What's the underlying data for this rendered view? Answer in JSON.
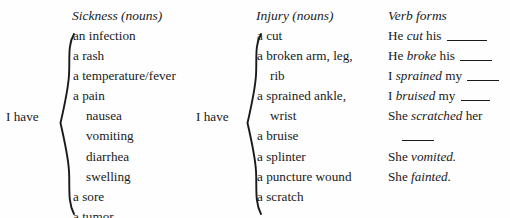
{
  "columns": [
    {
      "id": "sickness",
      "header": "Sickness (nouns)",
      "prefix_label": "I have",
      "items": [
        {
          "text": "an infection",
          "indent": false
        },
        {
          "text": "a rash",
          "indent": false
        },
        {
          "text": "a temperature/fever",
          "indent": false
        },
        {
          "text": "a pain",
          "indent": false
        },
        {
          "text": "nausea",
          "indent": true
        },
        {
          "text": "vomiting",
          "indent": true
        },
        {
          "text": "diarrhea",
          "indent": true
        },
        {
          "text": "swelling",
          "indent": true
        },
        {
          "text": "a sore",
          "indent": false
        },
        {
          "text": "a tumor",
          "indent": false
        }
      ]
    },
    {
      "id": "injury",
      "header": "Injury (nouns)",
      "prefix_label": "I have",
      "items": [
        {
          "text": "a cut",
          "indent": false
        },
        {
          "text": "a broken arm, leg,",
          "indent": false
        },
        {
          "text": "rib",
          "indent": true
        },
        {
          "text": "a sprained ankle,",
          "indent": false
        },
        {
          "text": "wrist",
          "indent": true
        },
        {
          "text": "a bruise",
          "indent": false
        },
        {
          "text": "a splinter",
          "indent": false
        },
        {
          "text": "a puncture wound",
          "indent": false
        },
        {
          "text": "a scratch",
          "indent": false
        }
      ]
    }
  ],
  "verb_forms": {
    "header": "Verb forms",
    "lines": [
      {
        "subject": "He ",
        "verb": "cut",
        "object": " his ",
        "blank": "long",
        "continuation": false
      },
      {
        "subject": "He ",
        "verb": "broke",
        "object": " his ",
        "blank": "med",
        "continuation": false
      },
      {
        "subject": "I ",
        "verb": "sprained",
        "object": " my ",
        "blank": "med",
        "continuation": false
      },
      {
        "subject": "I ",
        "verb": "bruised",
        "object": " my ",
        "blank": "short",
        "continuation": false
      },
      {
        "subject": "She ",
        "verb": "scratched",
        "object": " her",
        "blank": "none",
        "continuation": false
      },
      {
        "subject": "",
        "verb": "",
        "object": "",
        "blank": "med",
        "continuation": true
      },
      {
        "subject": "She ",
        "verb": "vomited.",
        "object": "",
        "blank": "none",
        "continuation": false
      },
      {
        "subject": "She ",
        "verb": "fainted.",
        "object": "",
        "blank": "none",
        "continuation": false
      }
    ]
  },
  "colors": {
    "text": "#1a1a1a",
    "background": "#fefefe"
  }
}
